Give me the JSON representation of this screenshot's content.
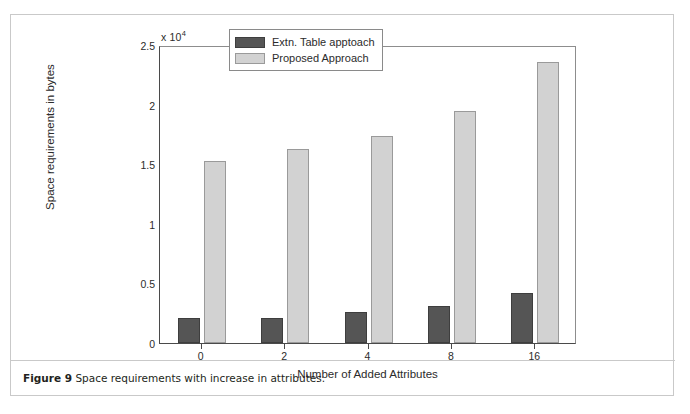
{
  "figure": {
    "caption_label": "Figure 9",
    "caption_text": "Space requirements with increase in attributes."
  },
  "chart_data": {
    "type": "bar",
    "title": "",
    "xlabel": "Number of Added Attributes",
    "ylabel": "Space requirements in bytes",
    "y_exponent_label": "x 10",
    "y_exponent_power": "4",
    "y_scale_factor": 10000,
    "categories": [
      "0",
      "2",
      "4",
      "8",
      "16"
    ],
    "series": [
      {
        "name": "Extn. Table apptoach",
        "color": "#555555",
        "values": [
          0.21,
          0.21,
          0.26,
          0.31,
          0.42
        ]
      },
      {
        "name": "Proposed Approach",
        "color": "#d2d2d2",
        "values": [
          1.53,
          1.63,
          1.74,
          1.95,
          2.36
        ]
      }
    ],
    "ylim": [
      0,
      2.5
    ],
    "y_ticks": [
      "0",
      "0.5",
      "1",
      "1.5",
      "2",
      "2.5"
    ],
    "y_tick_values": [
      0,
      0.5,
      1,
      1.5,
      2,
      2.5
    ],
    "x_ticks": [
      "0",
      "2",
      "4",
      "8",
      "16"
    ],
    "grid": false,
    "legend_position": "top-center"
  }
}
